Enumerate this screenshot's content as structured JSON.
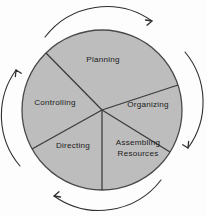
{
  "diagram": {
    "shape": "circle-divided-into-five-sectors",
    "colors": {
      "background": "#fdfdfd",
      "circle_fill": "#bdbdbd",
      "circle_stroke": "#4a4a4a",
      "divider_stroke": "#3a3a3a",
      "arrow_stroke": "#2e2e2e",
      "label_text": "#1a1a1a"
    },
    "circle": {
      "center_x": 102,
      "center_y": 110,
      "radius": 80
    },
    "sectors": [
      {
        "id": "planning",
        "label": "Planning",
        "label_x": 103,
        "label_y": 60
      },
      {
        "id": "organizing",
        "label": "Organizing",
        "label_x": 148,
        "label_y": 105
      },
      {
        "id": "assembling-resources",
        "label_line1": "Assembling",
        "label_line2": "Resources",
        "label_x": 138,
        "label_y": 147
      },
      {
        "id": "directing",
        "label": "Directing",
        "label_x": 73,
        "label_y": 146
      },
      {
        "id": "controlling",
        "label": "Controlling",
        "label_x": 55,
        "label_y": 103
      }
    ],
    "arrows": [
      {
        "id": "arrow-top",
        "direction": "clockwise-right",
        "position": "top"
      },
      {
        "id": "arrow-right",
        "direction": "clockwise-down",
        "position": "right"
      },
      {
        "id": "arrow-bottom",
        "direction": "clockwise-left",
        "position": "bottom"
      },
      {
        "id": "arrow-left",
        "direction": "clockwise-up",
        "position": "left"
      }
    ]
  }
}
